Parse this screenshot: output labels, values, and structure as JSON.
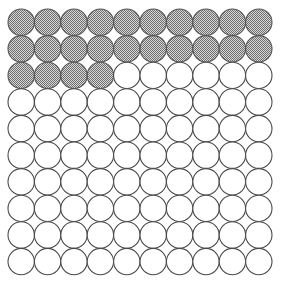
{
  "figure": {
    "grid": {
      "rows": 10,
      "columns": 10,
      "total_circles": 100,
      "shaded_count": 24,
      "unshaded_count": 76,
      "fraction_shaded": "24/100"
    },
    "geometry": {
      "origin_x": 8,
      "origin_y": 9,
      "pitch_x": 26.4,
      "pitch_y": 26.6,
      "radius": 13.2
    },
    "colors": {
      "background": "#ffffff",
      "circle_stroke": "#4a4a4a",
      "shaded_fill_dark": "#6e6e6e",
      "shaded_fill_light": "#d8d8d8",
      "unshaded_fill": "#ffffff"
    },
    "rows_state": [
      [
        "shaded",
        "shaded",
        "shaded",
        "shaded",
        "shaded",
        "shaded",
        "shaded",
        "shaded",
        "shaded",
        "shaded"
      ],
      [
        "shaded",
        "shaded",
        "shaded",
        "shaded",
        "shaded",
        "shaded",
        "shaded",
        "shaded",
        "shaded",
        "shaded"
      ],
      [
        "shaded",
        "shaded",
        "shaded",
        "shaded",
        "empty",
        "empty",
        "empty",
        "empty",
        "empty",
        "empty"
      ],
      [
        "empty",
        "empty",
        "empty",
        "empty",
        "empty",
        "empty",
        "empty",
        "empty",
        "empty",
        "empty"
      ],
      [
        "empty",
        "empty",
        "empty",
        "empty",
        "empty",
        "empty",
        "empty",
        "empty",
        "empty",
        "empty"
      ],
      [
        "empty",
        "empty",
        "empty",
        "empty",
        "empty",
        "empty",
        "empty",
        "empty",
        "empty",
        "empty"
      ],
      [
        "empty",
        "empty",
        "empty",
        "empty",
        "empty",
        "empty",
        "empty",
        "empty",
        "empty",
        "empty"
      ],
      [
        "empty",
        "empty",
        "empty",
        "empty",
        "empty",
        "empty",
        "empty",
        "empty",
        "empty",
        "empty"
      ],
      [
        "empty",
        "empty",
        "empty",
        "empty",
        "empty",
        "empty",
        "empty",
        "empty",
        "empty",
        "empty"
      ],
      [
        "empty",
        "empty",
        "empty",
        "empty",
        "empty",
        "empty",
        "empty",
        "empty",
        "empty",
        "empty"
      ]
    ]
  }
}
